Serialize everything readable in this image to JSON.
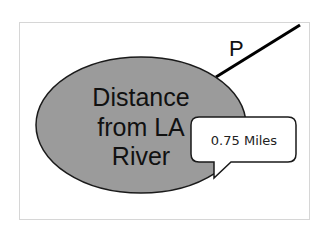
{
  "diagram": {
    "node": {
      "lines": [
        "Distance",
        "from LA",
        "River"
      ],
      "fill": "#9b9b9b",
      "stroke": "#1a1a1a"
    },
    "edge": {
      "label": "P",
      "stroke": "#000000"
    },
    "callout": {
      "text": "0.75 Miles",
      "fill": "#ffffff",
      "stroke": "#1a1a1a"
    }
  }
}
